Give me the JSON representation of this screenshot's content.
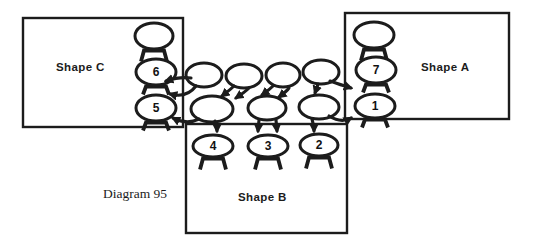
{
  "title": "Diagram 95",
  "labels": {
    "shape_c": "Shape C",
    "shape_a": "Shape A",
    "shape_b": "Shape B",
    "caption": "Diagram 95"
  },
  "colors": {
    "background": "#ffffff",
    "ink": "#1c1c1c"
  },
  "diagram": {
    "boxes": [
      {
        "id": "shape-c",
        "x": 23,
        "y": 18,
        "w": 160,
        "h": 109
      },
      {
        "id": "shape-a",
        "x": 345,
        "y": 13,
        "w": 164,
        "h": 106
      },
      {
        "id": "shape-b",
        "x": 186,
        "y": 124,
        "w": 161,
        "h": 109
      }
    ],
    "stools": [
      {
        "id": "c-top",
        "cx": 154,
        "cy": 36,
        "rx": 19,
        "ry": 13,
        "label": "",
        "legs": 11
      },
      {
        "id": "6",
        "cx": 156,
        "cy": 72,
        "rx": 20,
        "ry": 13,
        "label": "6",
        "legs": 8
      },
      {
        "id": "5",
        "cx": 156,
        "cy": 108,
        "rx": 20,
        "ry": 13,
        "label": "5",
        "legs": 8
      },
      {
        "id": "a-top",
        "cx": 374,
        "cy": 35,
        "rx": 20,
        "ry": 13,
        "label": "",
        "legs": 11
      },
      {
        "id": "7",
        "cx": 376,
        "cy": 70,
        "rx": 20,
        "ry": 13,
        "label": "7",
        "legs": 8
      },
      {
        "id": "1",
        "cx": 375,
        "cy": 106,
        "rx": 20,
        "ry": 12,
        "label": "1",
        "legs": 8
      },
      {
        "id": "free-top-1",
        "cx": 204,
        "cy": 75,
        "rx": 18,
        "ry": 12,
        "label": "",
        "legs": 0
      },
      {
        "id": "free-top-2",
        "cx": 244,
        "cy": 76,
        "rx": 18,
        "ry": 12,
        "label": "",
        "legs": 0
      },
      {
        "id": "free-top-3",
        "cx": 283,
        "cy": 75,
        "rx": 17,
        "ry": 12,
        "label": "",
        "legs": 0
      },
      {
        "id": "free-top-4",
        "cx": 321,
        "cy": 72,
        "rx": 18,
        "ry": 12,
        "label": "",
        "legs": 0
      },
      {
        "id": "free-mid-1",
        "cx": 212,
        "cy": 109,
        "rx": 21,
        "ry": 13,
        "label": "",
        "legs": 0
      },
      {
        "id": "free-mid-2",
        "cx": 267,
        "cy": 108,
        "rx": 19,
        "ry": 12,
        "label": "",
        "legs": 0
      },
      {
        "id": "free-mid-3",
        "cx": 319,
        "cy": 107,
        "rx": 20,
        "ry": 12,
        "label": "",
        "legs": 0
      },
      {
        "id": "4",
        "cx": 213,
        "cy": 146,
        "rx": 20,
        "ry": 11,
        "label": "4",
        "legs": 11
      },
      {
        "id": "3",
        "cx": 268,
        "cy": 146,
        "rx": 20,
        "ry": 11,
        "label": "3",
        "legs": 11
      },
      {
        "id": "2",
        "cx": 319,
        "cy": 145,
        "rx": 19,
        "ry": 11,
        "label": "2",
        "legs": 11
      }
    ],
    "arrows": [
      {
        "id": "top1-to-6",
        "from": "free-top-1",
        "to": "6",
        "path": "M 191,78 C 184,77 175,78 166,81"
      },
      {
        "id": "top1-to-6-legs",
        "from": "free-top-1",
        "to": "6",
        "path": "M 196,86 C 190,94 181,97 170,94"
      },
      {
        "id": "top2-to-mid1-a",
        "from": "free-top-2",
        "to": "free-mid-1",
        "path": "M 234,86 C 230,90 227,92 222,96"
      },
      {
        "id": "top2-to-mid1-b",
        "from": "free-top-2",
        "to": "free-mid-1",
        "path": "M 249,88 C 245,92 242,94 236,98"
      },
      {
        "id": "top3-to-mid2-a",
        "from": "free-top-3",
        "to": "free-mid-2",
        "path": "M 273,86 C 269,90 266,92 262,95"
      },
      {
        "id": "top3-to-mid2-b",
        "from": "free-top-3",
        "to": "free-mid-2",
        "path": "M 289,88 C 286,92 283,94 279,97"
      },
      {
        "id": "top4-to-mid3",
        "from": "free-top-4",
        "to": "free-mid-3",
        "path": "M 318,84 C 317,88 316,90 315,93"
      },
      {
        "id": "top4-to-7",
        "from": "free-top-4",
        "to": "7",
        "path": "M 330,81 C 338,84 345,86 351,88"
      },
      {
        "id": "mid1-to-5",
        "from": "free-mid-1",
        "to": "5",
        "path": "M 199,119 C 191,123 181,122 173,118"
      },
      {
        "id": "mid1-to-4",
        "from": "free-mid-1",
        "to": "4",
        "path": "M 215,121 C 216,125 217,128 217,131"
      },
      {
        "id": "mid2-to-3-a",
        "from": "free-mid-2",
        "to": "3",
        "path": "M 259,120 L 258,131"
      },
      {
        "id": "mid2-to-3-b",
        "from": "free-mid-2",
        "to": "3",
        "path": "M 276,120 L 277,131"
      },
      {
        "id": "mid3-to-2",
        "from": "free-mid-3",
        "to": "2",
        "path": "M 312,119 C 313,123 314,127 314,131"
      },
      {
        "id": "mid3-to-1",
        "from": "free-mid-3",
        "to": "1",
        "path": "M 329,116 C 337,121 344,122 351,118"
      }
    ]
  }
}
